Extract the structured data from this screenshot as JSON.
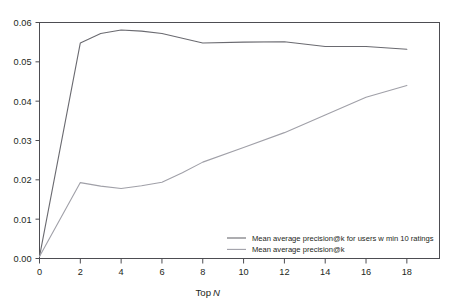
{
  "chart_data": {
    "type": "line",
    "title": "",
    "subtitle": "",
    "xlabel": "Top N",
    "xlabel_plain": "Top",
    "xlabel_italic": "N",
    "ylabel": "",
    "xlim": [
      0,
      19.6
    ],
    "ylim": [
      0,
      0.06
    ],
    "grid": false,
    "legend_position": "inside bottom-right",
    "x_ticks": [
      0,
      2,
      4,
      6,
      8,
      10,
      12,
      14,
      16,
      18
    ],
    "x_tick_labels": [
      "0",
      "2",
      "4",
      "6",
      "8",
      "10",
      "12",
      "14",
      "16",
      "18"
    ],
    "y_ticks": [
      0.0,
      0.01,
      0.02,
      0.03,
      0.04,
      0.05,
      0.06
    ],
    "y_tick_labels": [
      "0.00",
      "0.01",
      "0.02",
      "0.03",
      "0.04",
      "0.05",
      "0.06"
    ],
    "series": [
      {
        "name": "Mean average precision@k for users w min 10 ratings",
        "color": "#6a6a70",
        "x": [
          0,
          2,
          3,
          4,
          5,
          6,
          7,
          8,
          10,
          12,
          14,
          16,
          18
        ],
        "values": [
          0.0005,
          0.0548,
          0.0572,
          0.0581,
          0.0578,
          0.0572,
          0.056,
          0.0548,
          0.055,
          0.0551,
          0.0539,
          0.0539,
          0.0532
        ]
      },
      {
        "name": "Mean average precision@k",
        "color": "#a0a0a8",
        "x": [
          0,
          2,
          3,
          4,
          5,
          6,
          7,
          8,
          10,
          12,
          14,
          16,
          18
        ],
        "values": [
          0.0005,
          0.0193,
          0.0184,
          0.0178,
          0.0185,
          0.0194,
          0.0218,
          0.0245,
          0.0282,
          0.032,
          0.0365,
          0.041,
          0.044
        ]
      }
    ]
  },
  "legend": {
    "entries": [
      {
        "label": "Mean average precision@k for users w min 10 ratings",
        "color": "#6a6a70"
      },
      {
        "label": "Mean average precision@k",
        "color": "#a0a0a8"
      }
    ]
  },
  "style": {
    "frame_color": "#4d4d52",
    "text_color": "#231f20",
    "background": "#ffffff"
  }
}
